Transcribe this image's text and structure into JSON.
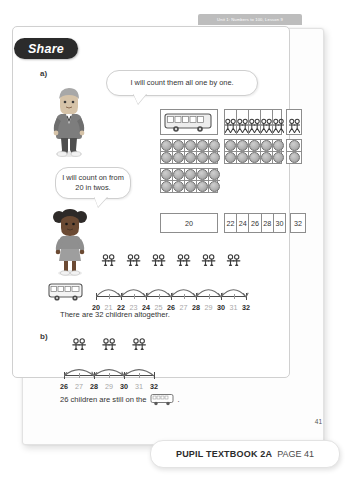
{
  "header": {
    "unit_label": "Unit 1: Numbers to 100, Lesson 9"
  },
  "share": {
    "label": "Share"
  },
  "parts": {
    "a_label": "a)",
    "b_label": "b)"
  },
  "bubbles": {
    "boy": "I will count them all one by one.",
    "girl": "I will count on from 20 in twos."
  },
  "number_boxes": {
    "first": "20",
    "middle": [
      "22",
      "24",
      "26",
      "28",
      "30"
    ],
    "last": "32"
  },
  "number_line_a": {
    "labels": [
      "20",
      "21",
      "22",
      "23",
      "24",
      "25",
      "26",
      "27",
      "28",
      "29",
      "30",
      "31",
      "32"
    ],
    "start": 20,
    "end": 32,
    "jump_starts": [
      20,
      22,
      24,
      26,
      28,
      30
    ],
    "jump_size": 2,
    "direction": "forward",
    "figures_per_jump": 2
  },
  "number_line_b": {
    "labels": [
      "26",
      "27",
      "28",
      "29",
      "30",
      "31",
      "32"
    ],
    "start": 26,
    "end": 32,
    "jump_starts": [
      32,
      30,
      28
    ],
    "jump_size": 2,
    "direction": "backward",
    "figures_per_jump": 2
  },
  "counters": {
    "left_frames": [
      10,
      10
    ],
    "right_frame": 10,
    "right_extra": 2,
    "people_cells": 5,
    "people_per_cell": 2,
    "people_extra_cells": 1
  },
  "sentences": {
    "a_result": "There are 32 children altogether.",
    "b_result_pre": "26 children are still on the",
    "b_result_post": "."
  },
  "footer": {
    "book": "PUPIL TEXTBOOK 2A",
    "page": "PAGE 41",
    "page_number": "41"
  },
  "icons": {
    "bus": "bus-icon",
    "person": "stick-figure-icon",
    "counter": "counter-dot-icon"
  },
  "colors": {
    "share_pill": "#2b2b2b",
    "unit_tab": "#bdbdbd",
    "line": "#4a4a4a",
    "odd_label": "#a8a8a8"
  }
}
